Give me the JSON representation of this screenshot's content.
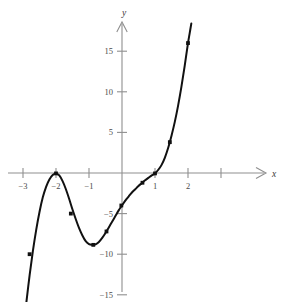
{
  "figure": {
    "title": "",
    "background_color": "#ffffff",
    "axis_color": "#8f8f8f",
    "curve_color": "#111111",
    "tick_label_color": "#4a4a4a"
  },
  "axes": {
    "x_axis_label": "x",
    "y_axis_label": "y",
    "x_ticks": [
      {
        "value": -3,
        "label": "−3"
      },
      {
        "value": -2,
        "label": "−2"
      },
      {
        "value": -1,
        "label": "−1"
      },
      {
        "value": 1,
        "label": "1"
      },
      {
        "value": 2,
        "label": "2"
      },
      {
        "value": 3,
        "label": ""
      }
    ],
    "y_ticks": [
      {
        "value": 15,
        "label": "15"
      },
      {
        "value": 10,
        "label": "10"
      },
      {
        "value": 5,
        "label": "5"
      },
      {
        "value": -5,
        "label": "−5"
      },
      {
        "value": -10,
        "label": "−10"
      },
      {
        "value": -15,
        "label": "−15"
      }
    ],
    "x_arrow": true,
    "y_arrow": true
  },
  "chart_data": {
    "type": "line",
    "title": "",
    "xlabel": "x",
    "ylabel": "y",
    "xlim": [
      -3.05,
      3.6
    ],
    "ylim": [
      -17.7,
      18.0
    ],
    "grid": false,
    "legend": "none",
    "series": [
      {
        "name": "curve",
        "x": [
          -2.9,
          -2.8,
          -2.7,
          -2.6,
          -2.5,
          -2.4,
          -2.3,
          -2.2,
          -2.1,
          -2.0,
          -1.9,
          -1.8,
          -1.7,
          -1.6,
          -1.5,
          -1.4,
          -1.3,
          -1.2,
          -1.1,
          -1.0,
          -0.9,
          -0.85,
          -0.8,
          -0.7,
          -0.6,
          -0.5,
          -0.4,
          -0.3,
          -0.2,
          -0.1,
          0.0,
          0.1,
          0.2,
          0.3,
          0.4,
          0.5,
          0.6,
          0.7,
          0.8,
          0.9,
          1.0,
          1.1,
          1.2,
          1.3,
          1.4,
          1.5,
          1.6,
          1.7,
          1.8,
          1.9,
          2.0,
          2.05,
          2.1
        ],
        "y": [
          -16.0,
          -12.6,
          -9.6,
          -7.0,
          -4.8,
          -3.0,
          -1.7,
          -0.8,
          -0.25,
          -0.05,
          -0.3,
          -1.0,
          -2.0,
          -3.2,
          -4.5,
          -5.7,
          -6.8,
          -7.7,
          -8.4,
          -8.75,
          -8.85,
          -8.85,
          -8.8,
          -8.5,
          -8.0,
          -7.4,
          -6.7,
          -6.0,
          -5.3,
          -4.6,
          -4.0,
          -3.4,
          -2.9,
          -2.4,
          -2.0,
          -1.6,
          -1.25,
          -0.9,
          -0.6,
          -0.3,
          -0.05,
          0.4,
          1.0,
          1.9,
          3.1,
          4.6,
          6.3,
          8.3,
          10.6,
          13.2,
          16.0,
          17.2,
          18.4
        ]
      }
    ],
    "marked_points": [
      {
        "x": -2.8,
        "y": -10.0
      },
      {
        "x": -2.0,
        "y": -0.05
      },
      {
        "x": -1.55,
        "y": -5.0
      },
      {
        "x": -0.87,
        "y": -8.85
      },
      {
        "x": -0.47,
        "y": -7.2
      },
      {
        "x": -0.02,
        "y": -4.0
      },
      {
        "x": 0.62,
        "y": -1.2
      },
      {
        "x": 1.0,
        "y": -0.05
      },
      {
        "x": 1.45,
        "y": 3.8
      },
      {
        "x": 2.0,
        "y": 16.0
      }
    ]
  }
}
